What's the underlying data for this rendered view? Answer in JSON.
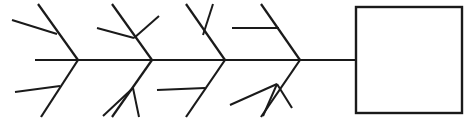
{
  "diagram": {
    "kind": "fishbone-ishikawa-diagram",
    "title": "",
    "stroke_color": "#1a1a1a",
    "background_color": "#ffffff",
    "canvas": {
      "width": 468,
      "height": 124
    },
    "spine": {
      "label": "",
      "x1": 35,
      "y1": 60,
      "x2": 356,
      "y2": 60
    },
    "head_box": {
      "label": "",
      "x": 356,
      "y": 7,
      "width": 106,
      "height": 106
    },
    "rib_groups": [
      {
        "name": "rib-group-1",
        "vertex_x": 78,
        "upper": {
          "rib": {
            "x1": 78,
            "y1": 60,
            "x2": 38,
            "y2": 4
          },
          "twigs": [
            {
              "x1": 12,
              "y1": 20,
              "x2": 57,
              "y2": 34
            }
          ]
        },
        "lower": {
          "rib": {
            "x1": 78,
            "y1": 60,
            "x2": 41,
            "y2": 117
          },
          "twigs": [
            {
              "x1": 15,
              "y1": 92,
              "x2": 60,
              "y2": 86
            }
          ]
        }
      },
      {
        "name": "rib-group-2",
        "vertex_x": 152,
        "upper": {
          "rib": {
            "x1": 152,
            "y1": 60,
            "x2": 112,
            "y2": 4
          },
          "twigs": [
            {
              "x1": 97,
              "y1": 28,
              "x2": 134,
              "y2": 38
            },
            {
              "x1": 134,
              "y1": 38,
              "x2": 159,
              "y2": 16
            }
          ]
        },
        "lower": {
          "rib": {
            "x1": 152,
            "y1": 60,
            "x2": 112,
            "y2": 117
          },
          "twigs": [
            {
              "x1": 103,
              "y1": 116,
              "x2": 133,
              "y2": 88
            },
            {
              "x1": 133,
              "y1": 88,
              "x2": 139,
              "y2": 117
            }
          ]
        }
      },
      {
        "name": "rib-group-3",
        "vertex_x": 225,
        "upper": {
          "rib": {
            "x1": 225,
            "y1": 60,
            "x2": 186,
            "y2": 4
          },
          "twigs": [
            {
              "x1": 213,
              "y1": 4,
              "x2": 203,
              "y2": 35
            }
          ]
        },
        "lower": {
          "rib": {
            "x1": 225,
            "y1": 60,
            "x2": 186,
            "y2": 117
          },
          "twigs": [
            {
              "x1": 157,
              "y1": 90,
              "x2": 205,
              "y2": 88
            }
          ]
        }
      },
      {
        "name": "rib-group-4",
        "vertex_x": 300,
        "upper": {
          "rib": {
            "x1": 300,
            "y1": 60,
            "x2": 261,
            "y2": 4
          },
          "twigs": [
            {
              "x1": 232,
              "y1": 28,
              "x2": 279,
              "y2": 28
            }
          ]
        },
        "lower": {
          "rib": {
            "x1": 300,
            "y1": 60,
            "x2": 261,
            "y2": 117
          },
          "twigs": [
            {
              "x1": 230,
              "y1": 105,
              "x2": 277,
              "y2": 84
            },
            {
              "x1": 277,
              "y1": 84,
              "x2": 292,
              "y2": 108
            },
            {
              "x1": 277,
              "y1": 84,
              "x2": 263,
              "y2": 116
            }
          ]
        }
      }
    ]
  }
}
